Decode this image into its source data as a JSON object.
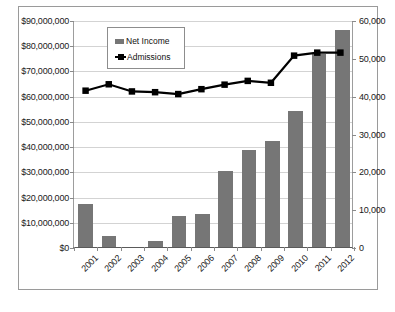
{
  "chart_data": {
    "type": "bar",
    "title": "",
    "xlabel": "",
    "categories": [
      "2001",
      "2002",
      "2003",
      "2004",
      "2005",
      "2006",
      "2007",
      "2008",
      "2009",
      "2010",
      "2011",
      "2012"
    ],
    "grid": true,
    "legend_position": "top-left",
    "series": [
      {
        "name": "Net Income",
        "type": "bar",
        "axis": "left",
        "color": "#767676",
        "values": [
          17000000,
          4500000,
          0,
          2300000,
          12300000,
          13000000,
          30000000,
          38500000,
          42000000,
          54000000,
          76500000,
          86000000
        ]
      },
      {
        "name": "Admissions",
        "type": "line",
        "axis": "right",
        "color": "#000000",
        "values": [
          41500,
          43200,
          41300,
          41100,
          40600,
          41900,
          43100,
          44100,
          43600,
          50800,
          51600,
          51600
        ]
      }
    ],
    "axes": {
      "left": {
        "label": "",
        "ylim": [
          0,
          90000000
        ],
        "ticks": [
          0,
          10000000,
          20000000,
          30000000,
          40000000,
          50000000,
          60000000,
          70000000,
          80000000,
          90000000
        ],
        "ticklabels": [
          "$0",
          "$10,000,000",
          "$20,000,000",
          "$30,000,000",
          "$40,000,000",
          "$50,000,000",
          "$60,000,000",
          "$70,000,000",
          "$80,000,000",
          "$90,000,000"
        ]
      },
      "right": {
        "label": "",
        "ylim": [
          0,
          60000
        ],
        "ticks": [
          0,
          10000,
          20000,
          30000,
          40000,
          50000,
          60000
        ],
        "ticklabels": [
          "0",
          "10,000",
          "20,000",
          "30,000",
          "40,000",
          "50,000",
          "60,000"
        ]
      }
    },
    "legend": [
      {
        "label": "Net Income",
        "marker": "bar-swatch"
      },
      {
        "label": "Admissions",
        "marker": "line-marker-swatch"
      }
    ]
  }
}
